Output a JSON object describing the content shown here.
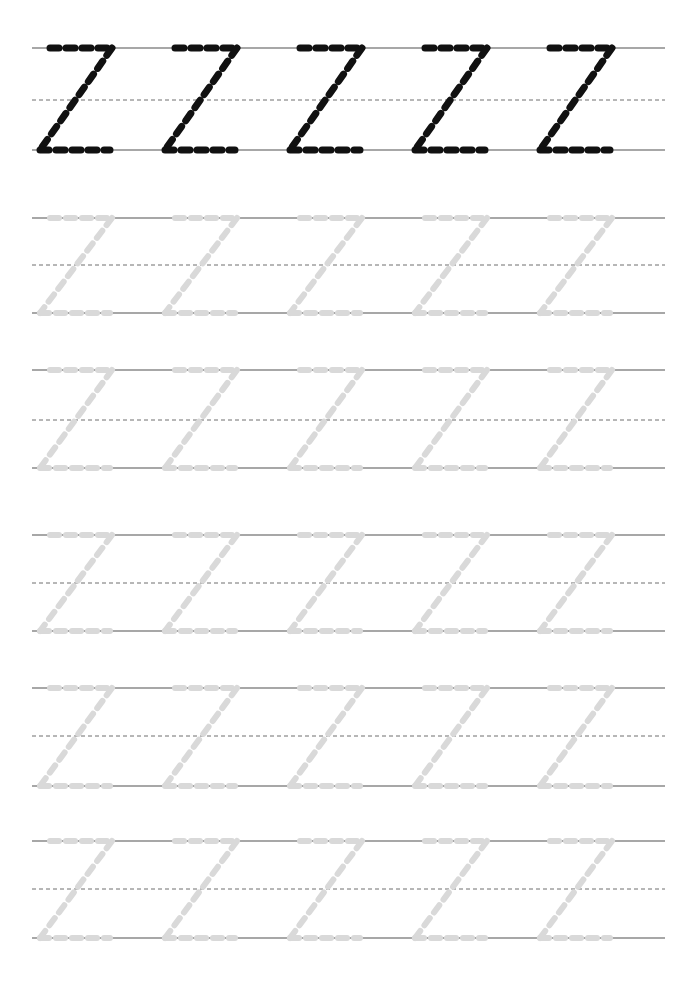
{
  "worksheet": {
    "title": "Letter Z Tracing Practice Worksheet",
    "letter": "Z",
    "letter_case": "uppercase",
    "page_width": 699,
    "page_height": 984,
    "background_color": "#ffffff",
    "rule_line_color": "#8a8a8a",
    "midline_color": "#6f6f6f",
    "model_letter_color": "#111111",
    "trace_letter_color": "#d9d9d9",
    "rule_left_x": 32,
    "rule_right_x": 665,
    "letters_per_row": 5,
    "letter_start_x": 40,
    "letter_pitch": 125,
    "rows": [
      {
        "index": 1,
        "name": "model-row",
        "style": "solid-dark",
        "top_y": 48,
        "mid_y": 100,
        "bottom_y": 150,
        "letter_color": "#111111",
        "stroke_width": 7,
        "dash": "9 7",
        "letters": [
          "Z",
          "Z",
          "Z",
          "Z",
          "Z"
        ]
      },
      {
        "index": 2,
        "name": "trace-row-1",
        "style": "faded-trace",
        "top_y": 218,
        "mid_y": 265,
        "bottom_y": 313,
        "letter_color": "#d9d9d9",
        "stroke_width": 6,
        "dash": "9 7",
        "letters": [
          "Z",
          "Z",
          "Z",
          "Z",
          "Z"
        ]
      },
      {
        "index": 3,
        "name": "trace-row-2",
        "style": "faded-trace",
        "top_y": 370,
        "mid_y": 420,
        "bottom_y": 468,
        "letter_color": "#d9d9d9",
        "stroke_width": 6,
        "dash": "9 7",
        "letters": [
          "Z",
          "Z",
          "Z",
          "Z",
          "Z"
        ]
      },
      {
        "index": 4,
        "name": "trace-row-3",
        "style": "faded-trace",
        "top_y": 535,
        "mid_y": 583,
        "bottom_y": 631,
        "letter_color": "#d9d9d9",
        "stroke_width": 6,
        "dash": "9 7",
        "letters": [
          "Z",
          "Z",
          "Z",
          "Z",
          "Z"
        ]
      },
      {
        "index": 5,
        "name": "trace-row-4",
        "style": "faded-trace",
        "top_y": 688,
        "mid_y": 736,
        "bottom_y": 786,
        "letter_color": "#d9d9d9",
        "stroke_width": 6,
        "dash": "9 7",
        "letters": [
          "Z",
          "Z",
          "Z",
          "Z",
          "Z"
        ]
      },
      {
        "index": 6,
        "name": "trace-row-5",
        "style": "faded-trace",
        "top_y": 841,
        "mid_y": 889,
        "bottom_y": 938,
        "letter_color": "#d9d9d9",
        "stroke_width": 6,
        "dash": "9 7",
        "letters": [
          "Z",
          "Z",
          "Z",
          "Z",
          "Z"
        ]
      }
    ],
    "glyph": {
      "name": "uppercase-Z-slanted",
      "top_left_offset": 10,
      "top_right_offset": 72,
      "bottom_left_offset": 0,
      "bottom_right_offset": 70,
      "description": "Dashed uppercase Z: horizontal top stroke, diagonal from top-right down to bottom-left, horizontal bottom stroke"
    }
  }
}
